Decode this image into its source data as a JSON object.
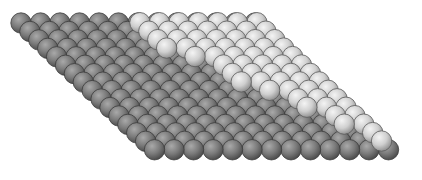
{
  "scene": {
    "description": "3D rendered atomic surface: a single-layer rhombic lattice of dark grey spheres with a partial second layer of light grey spheres forming a step edge",
    "width": 422,
    "height": 180,
    "background": "#ffffff"
  },
  "lattice": {
    "rows": 16,
    "cols": 13,
    "origin": [
      21,
      23
    ],
    "col_step": [
      19.5,
      0
    ],
    "row_step": [
      8.9,
      8.45
    ],
    "radius": 10.2
  },
  "layers": [
    {
      "name": "substrate",
      "color_light": "#a9a9a9",
      "color_mid": "#7a7a7a",
      "color_dark": "#4a4a4a",
      "stroke": "#3c3c3c"
    },
    {
      "name": "adlayer",
      "color_light": "#f4f4f4",
      "color_mid": "#cfcfcf",
      "color_dark": "#8f8f8f",
      "stroke": "#5a5a5a",
      "offset": [
        -2.5,
        -4.5
      ],
      "row_start_col": [
        6,
        6,
        6,
        6,
        7,
        8,
        8,
        8,
        9,
        10,
        10,
        11,
        11,
        12,
        12
      ],
      "rows": 15
    }
  ]
}
